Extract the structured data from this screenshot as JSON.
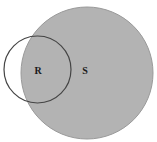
{
  "diagram": {
    "type": "venn",
    "background": "#ffffff",
    "sets": [
      {
        "id": "S",
        "label": "S",
        "shape": "circle",
        "center": [
          87,
          73
        ],
        "radius": 66,
        "fill": "#b3b3b3",
        "stroke": "#9a9a9a",
        "label_position": [
          85,
          70
        ]
      },
      {
        "id": "R",
        "label": "R",
        "shape": "circle",
        "center": [
          37.5,
          69.5
        ],
        "radius": 33.5,
        "fill": "none",
        "stroke": "#444444",
        "label_position": [
          38,
          70
        ]
      }
    ]
  }
}
